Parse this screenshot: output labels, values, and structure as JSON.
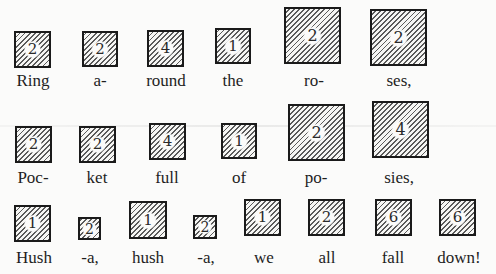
{
  "hatch_color": "#5a5a5a",
  "border_color": "#1a1a1a",
  "lines": [
    {
      "syllables": [
        {
          "text": "Ring",
          "value": "2"
        },
        {
          "text": "a-",
          "value": "2"
        },
        {
          "text": "round",
          "value": "4"
        },
        {
          "text": "the",
          "value": "1"
        },
        {
          "text": "ro-",
          "value": "2"
        },
        {
          "text": "ses,",
          "value": "2"
        }
      ]
    },
    {
      "syllables": [
        {
          "text": "Poc-",
          "value": "2"
        },
        {
          "text": "ket",
          "value": "2"
        },
        {
          "text": "full",
          "value": "4"
        },
        {
          "text": "of",
          "value": "1"
        },
        {
          "text": "po-",
          "value": "2"
        },
        {
          "text": "sies,",
          "value": "4"
        }
      ]
    },
    {
      "syllables": [
        {
          "text": "Hush",
          "value": "1"
        },
        {
          "text": "-a,",
          "value": "2"
        },
        {
          "text": "hush",
          "value": "1"
        },
        {
          "text": "-a,",
          "value": "2"
        },
        {
          "text": "we",
          "value": "1"
        },
        {
          "text": "all",
          "value": "2"
        },
        {
          "text": "fall",
          "value": "6"
        },
        {
          "text": "down!",
          "value": "6"
        }
      ]
    }
  ]
}
